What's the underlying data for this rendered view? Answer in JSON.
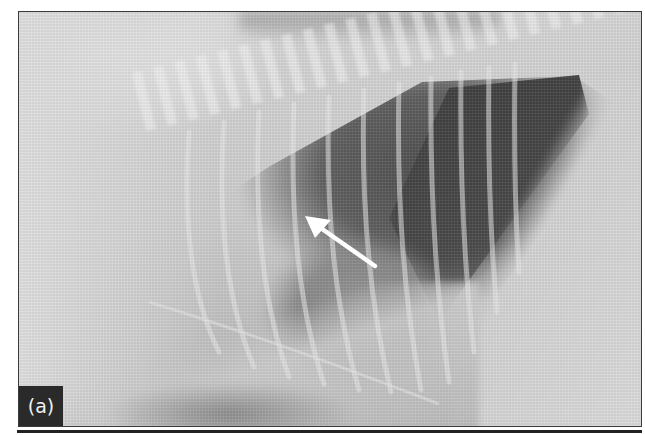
{
  "figure": {
    "panel_label": "(a)",
    "annotation": {
      "type": "arrow",
      "color": "#ffffff",
      "direction": "up-left"
    }
  }
}
